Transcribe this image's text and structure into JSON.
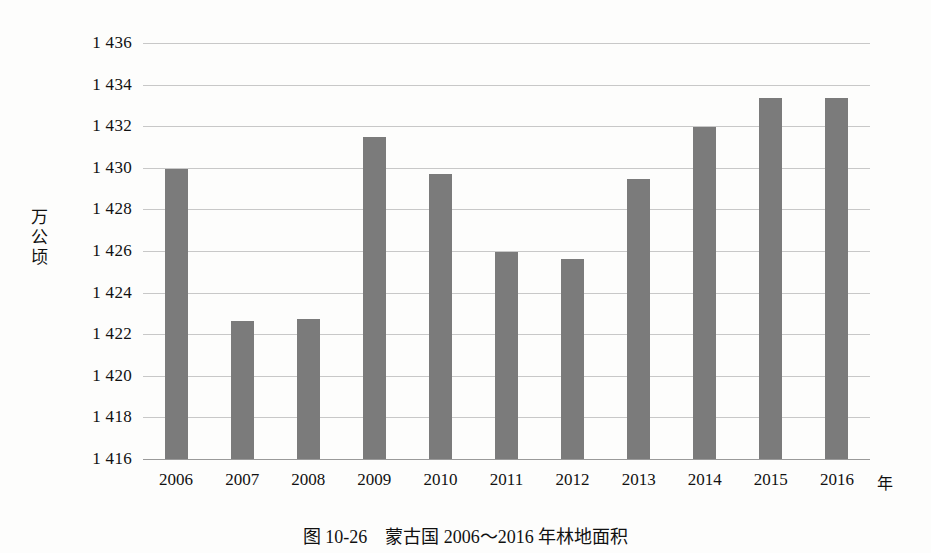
{
  "figure": {
    "caption_number": "图 10-26",
    "caption_title": "蒙古国 2006～2016 年林地面积",
    "x_axis_unit": "年",
    "y_axis_title": "万公顷",
    "y_axis_title_chars": [
      "万",
      "公",
      "顷"
    ]
  },
  "chart_data": {
    "type": "bar",
    "xlabel": "年",
    "ylabel": "万公顷",
    "categories": [
      "2006",
      "2007",
      "2008",
      "2009",
      "2010",
      "2011",
      "2012",
      "2013",
      "2014",
      "2015",
      "2016"
    ],
    "values": [
      1429.95,
      1422.65,
      1422.75,
      1431.5,
      1429.7,
      1425.95,
      1425.6,
      1429.45,
      1431.95,
      1433.35,
      1433.35
    ],
    "ylim": [
      1416,
      1436
    ],
    "ytick_step": 2,
    "ytick_labels": [
      "1 436",
      "1 434",
      "1 432",
      "1 430",
      "1 428",
      "1 426",
      "1 424",
      "1 422",
      "1 420",
      "1 418",
      "1 416"
    ],
    "ytick_values": [
      1436,
      1434,
      1432,
      1430,
      1428,
      1426,
      1424,
      1422,
      1420,
      1418,
      1416
    ],
    "grid": true,
    "legend": null,
    "bar_color": "#7b7b7b",
    "gridline_color": "#c8c8c8",
    "background_color": "#fdfdfc"
  }
}
